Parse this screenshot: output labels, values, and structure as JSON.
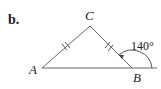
{
  "figure": {
    "part_label": "b.",
    "vertices": {
      "A": {
        "label": "A"
      },
      "B": {
        "label": "B"
      },
      "C": {
        "label": "C"
      }
    },
    "exterior_angle": {
      "at": "B",
      "value": "140°"
    },
    "congruent_sides": [
      "AC",
      "BC"
    ],
    "colors": {
      "stroke": "#555555",
      "text": "#222222"
    }
  }
}
